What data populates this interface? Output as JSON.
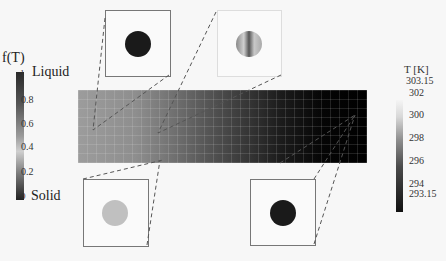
{
  "left_colorbar": {
    "title": "f(T)",
    "top_label": "Liquid",
    "bottom_label": "Solid",
    "ticks": [
      "1",
      "0.8",
      "0.6",
      "0.4",
      "0.2",
      "0"
    ]
  },
  "right_colorbar": {
    "title": "T [K]",
    "ticks": [
      "303.15",
      "302",
      "300",
      "298",
      "296",
      "294",
      "293.15"
    ]
  },
  "insets": [
    {
      "position": "top-left",
      "circle_state": "dark"
    },
    {
      "position": "top-right",
      "circle_state": "gradient"
    },
    {
      "position": "bottom-left",
      "circle_state": "light"
    },
    {
      "position": "bottom-right",
      "circle_state": "dark"
    }
  ],
  "colors": {
    "slab_hot": "#9c9c9c",
    "slab_cold": "#000000",
    "dark_circle": "#1a1a1a",
    "light_circle": "#c0c0c0",
    "dashes": "#555555"
  }
}
